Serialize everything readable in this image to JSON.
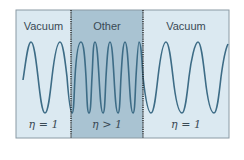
{
  "diagram": {
    "regions": [
      {
        "name": "Vacuum",
        "index_label": "η = 1",
        "shade": "#dbe9f1"
      },
      {
        "name": "Other",
        "index_label": "η > 1",
        "shade": "#a9c3d2"
      },
      {
        "name": "Vacuum",
        "index_label": "η = 1",
        "shade": "#dbe9f1"
      }
    ],
    "colors": {
      "wave": "#3d6c86",
      "border": "#8a9aa4",
      "divider": "#222222",
      "text": "#3a4a55"
    }
  }
}
